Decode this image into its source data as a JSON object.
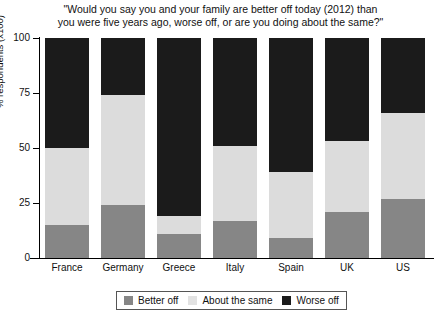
{
  "chart_data": {
    "type": "bar",
    "subtype": "stacked-bar-100",
    "title": "\"Would you say you and your family are better off today (2012) than you were five years ago, worse off, or are you doing about the same?\"",
    "title_line1": "\"Would you say you and your family are better off today (2012) than",
    "title_line2": "you were five years ago, worse off, or are you doing about the same?\"",
    "xlabel": "",
    "ylabel": "% respondents (x100)",
    "ylim": [
      0,
      100
    ],
    "yticks": [
      0,
      25,
      50,
      75,
      100
    ],
    "ytick_labels": [
      "0",
      "25",
      "50",
      "75",
      "100"
    ],
    "grid": false,
    "legend_position": "bottom",
    "categories": [
      "France",
      "Germany",
      "Greece",
      "Italy",
      "Spain",
      "UK",
      "US"
    ],
    "series": [
      {
        "name": "Better off",
        "color": "#868686",
        "values": [
          15,
          24,
          11,
          17,
          9,
          21,
          27
        ]
      },
      {
        "name": "About the same",
        "color": "#dcdcdc",
        "values": [
          35,
          50,
          8,
          34,
          30,
          32,
          39
        ]
      },
      {
        "name": "Worse off",
        "color": "#1b1b1b",
        "values": [
          50,
          26,
          81,
          49,
          61,
          47,
          34
        ]
      }
    ]
  },
  "legend": {
    "items": [
      {
        "label": "Better off",
        "color": "#868686"
      },
      {
        "label": "About the same",
        "color": "#e2e2e2"
      },
      {
        "label": "Worse off",
        "color": "#1b1b1b"
      }
    ]
  }
}
